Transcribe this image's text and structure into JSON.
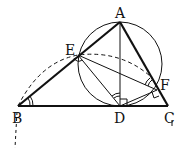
{
  "diagram": {
    "type": "geometry",
    "points": {
      "A": {
        "label": "A",
        "x": 120,
        "y": 22
      },
      "B": {
        "label": "B",
        "x": 18,
        "y": 106
      },
      "C": {
        "label": "C",
        "x": 168,
        "y": 106
      },
      "D": {
        "label": "D",
        "x": 120,
        "y": 106
      },
      "E": {
        "label": "E",
        "x": 78,
        "y": 55
      },
      "F": {
        "label": "F",
        "x": 157,
        "y": 90
      }
    },
    "thick_segments": [
      "AB",
      "BC",
      "AC"
    ],
    "thin_segments": [
      "AD",
      "ED",
      "EF",
      "DF"
    ],
    "circle": {
      "through": [
        "A",
        "E",
        "D",
        "F"
      ],
      "cx": 120,
      "cy": 64,
      "r": 42
    },
    "dashed_arc": {
      "from": "B",
      "through": "E",
      "to": "F"
    },
    "right_angle_marks": [
      "D (AD ⟂ BC)",
      "E (DE ⟂ AB)",
      "F (DF ⟂ AC)"
    ],
    "angle_marks": [
      "angle ABC (double)",
      "angle ADE (double)",
      "angle AFE (double)"
    ],
    "colors": {
      "stroke": "#111111",
      "background": "#ffffff"
    }
  }
}
